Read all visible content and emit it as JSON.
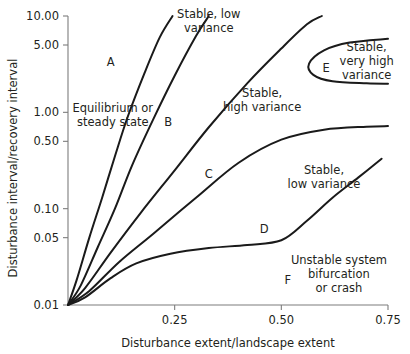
{
  "chart_data": {
    "type": "line",
    "title": "",
    "subtitle": "",
    "xlabel": "Disturbance extent/landscape extent",
    "ylabel": "Disturbance interval/recovery interval",
    "xlim": [
      0,
      0.75
    ],
    "ylim": [
      0.01,
      10.0
    ],
    "yscale": "log",
    "grid": false,
    "legend": null,
    "xticks": [
      {
        "value": 0.25,
        "label": "0.25"
      },
      {
        "value": 0.5,
        "label": "0.50"
      },
      {
        "value": 0.75,
        "label": "0.75"
      }
    ],
    "yticks": [
      {
        "value": 10.0,
        "label": "10.00"
      },
      {
        "value": 5.0,
        "label": "5.00"
      },
      {
        "value": 1.0,
        "label": "1.00"
      },
      {
        "value": 0.5,
        "label": "0.50"
      },
      {
        "value": 0.1,
        "label": "0.10"
      },
      {
        "value": 0.05,
        "label": "0.05"
      },
      {
        "value": 0.01,
        "label": "0.01"
      }
    ],
    "series": [
      {
        "name": "boundary-A-B",
        "comment": "steepest curve from origin to top axis",
        "points": [
          [
            0.0,
            0.01
          ],
          [
            0.02,
            0.018
          ],
          [
            0.05,
            0.05
          ],
          [
            0.08,
            0.13
          ],
          [
            0.11,
            0.35
          ],
          [
            0.14,
            0.9
          ],
          [
            0.18,
            2.6
          ],
          [
            0.215,
            6.0
          ],
          [
            0.245,
            10.0
          ]
        ]
      },
      {
        "name": "boundary-B-C",
        "comment": "second curve from origin to top axis",
        "points": [
          [
            0.0,
            0.01
          ],
          [
            0.03,
            0.016
          ],
          [
            0.07,
            0.04
          ],
          [
            0.11,
            0.1
          ],
          [
            0.15,
            0.28
          ],
          [
            0.2,
            0.85
          ],
          [
            0.25,
            2.4
          ],
          [
            0.3,
            6.2
          ],
          [
            0.33,
            10.0
          ]
        ]
      },
      {
        "name": "boundary-C-lowvar-top",
        "comment": "curve reaching the top axis near x=0.60 forming 'Stable, low variance' upper zone",
        "points": [
          [
            0.0,
            0.01
          ],
          [
            0.04,
            0.015
          ],
          [
            0.1,
            0.035
          ],
          [
            0.17,
            0.09
          ],
          [
            0.25,
            0.25
          ],
          [
            0.33,
            0.7
          ],
          [
            0.42,
            2.0
          ],
          [
            0.5,
            4.6
          ],
          [
            0.56,
            8.2
          ],
          [
            0.595,
            10.0
          ]
        ]
      },
      {
        "name": "boundary-C-D",
        "comment": "curve flattening toward right edge around y=0.7",
        "points": [
          [
            0.0,
            0.01
          ],
          [
            0.05,
            0.014
          ],
          [
            0.12,
            0.028
          ],
          [
            0.2,
            0.055
          ],
          [
            0.3,
            0.13
          ],
          [
            0.4,
            0.3
          ],
          [
            0.5,
            0.52
          ],
          [
            0.6,
            0.66
          ],
          [
            0.7,
            0.71
          ],
          [
            0.75,
            0.72
          ]
        ]
      },
      {
        "name": "boundary-D-F",
        "comment": "lower boundary, nearly flat near y=0.04 then rising steeply past x=0.50",
        "points": [
          [
            0.0,
            0.01
          ],
          [
            0.04,
            0.012
          ],
          [
            0.1,
            0.019
          ],
          [
            0.16,
            0.027
          ],
          [
            0.24,
            0.034
          ],
          [
            0.33,
            0.039
          ],
          [
            0.42,
            0.042
          ],
          [
            0.5,
            0.047
          ],
          [
            0.56,
            0.075
          ],
          [
            0.62,
            0.13
          ],
          [
            0.68,
            0.21
          ],
          [
            0.735,
            0.33
          ]
        ]
      },
      {
        "name": "boundary-E-nose",
        "comment": "U-shaped nose opening right, enclosing region E at top right",
        "points": [
          [
            0.75,
            5.8
          ],
          [
            0.66,
            5.3
          ],
          [
            0.6,
            4.4
          ],
          [
            0.565,
            3.2
          ],
          [
            0.575,
            2.45
          ],
          [
            0.62,
            2.1
          ],
          [
            0.7,
            2.0
          ],
          [
            0.75,
            1.98
          ]
        ]
      }
    ],
    "annotations": [
      {
        "name": "region-letter-a",
        "text": "A",
        "x": 0.1,
        "y": 3.0
      },
      {
        "name": "region-letter-b",
        "text": "B",
        "x": 0.235,
        "y": 0.72
      },
      {
        "name": "region-letter-c",
        "text": "C",
        "x": 0.33,
        "y": 0.21
      },
      {
        "name": "region-letter-d",
        "text": "D",
        "x": 0.46,
        "y": 0.056
      },
      {
        "name": "region-letter-e",
        "text": "E",
        "x": 0.605,
        "y": 2.6
      },
      {
        "name": "region-letter-f",
        "text": "F",
        "x": 0.515,
        "y": 0.0165
      },
      {
        "name": "label-equilibrium",
        "lines": [
          "Equilibrium or",
          "steady state"
        ],
        "x": 0.105,
        "y": 1.0
      },
      {
        "name": "label-stable-low-variance-top",
        "lines": [
          "Stable, low",
          "variance"
        ],
        "x": 0.33,
        "y": 9.6
      },
      {
        "name": "label-stable-high-variance",
        "lines": [
          "Stable,",
          "high variance"
        ],
        "x": 0.455,
        "y": 1.45
      },
      {
        "name": "label-stable-very-high-variance",
        "lines": [
          "Stable,",
          "very high",
          "variance"
        ],
        "x": 0.7,
        "y": 4.3
      },
      {
        "name": "label-stable-low-variance-mid",
        "lines": [
          "Stable,",
          "low variance"
        ],
        "x": 0.6,
        "y": 0.23
      },
      {
        "name": "label-unstable",
        "lines": [
          "Unstable system",
          "bifurcation",
          "or crash"
        ],
        "x": 0.635,
        "y": 0.0265
      }
    ]
  },
  "colors": {
    "curve": "#1a1a1a",
    "axis": "#7d7d7d",
    "text": "#231f20",
    "background": "#ffffff"
  }
}
